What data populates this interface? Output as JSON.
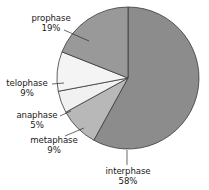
{
  "chart_data": {
    "type": "pie",
    "title": "",
    "start_angle_deg": 0,
    "direction": "clockwise",
    "center": [
      128,
      78
    ],
    "radius": 71,
    "slices": [
      {
        "label": "interphase",
        "value": 58,
        "pct_label": "58%",
        "color": "#8c8c8c"
      },
      {
        "label": "metaphase",
        "value": 9,
        "pct_label": "9%",
        "color": "#b8b8b8"
      },
      {
        "label": "anaphase",
        "value": 5,
        "pct_label": "5%",
        "color": "#f1f1f1"
      },
      {
        "label": "telophase",
        "value": 9,
        "pct_label": "9%",
        "color": "#f4f4f4"
      },
      {
        "label": "prophase",
        "value": 19,
        "pct_label": "19%",
        "color": "#999999"
      }
    ],
    "categories": [
      "interphase",
      "metaphase",
      "anaphase",
      "telophase",
      "prophase"
    ],
    "values": [
      58,
      9,
      5,
      9,
      19
    ],
    "legend": "none (direct labels with leader lines)",
    "outline_color": "#3a3a3a"
  },
  "labels": {
    "prophase": {
      "name": "prophase",
      "pct": "19%"
    },
    "telophase": {
      "name": "telophase",
      "pct": "9%"
    },
    "anaphase": {
      "name": "anaphase",
      "pct": "5%"
    },
    "metaphase": {
      "name": "metaphase",
      "pct": "9%"
    },
    "interphase": {
      "name": "interphase",
      "pct": "58%"
    }
  }
}
